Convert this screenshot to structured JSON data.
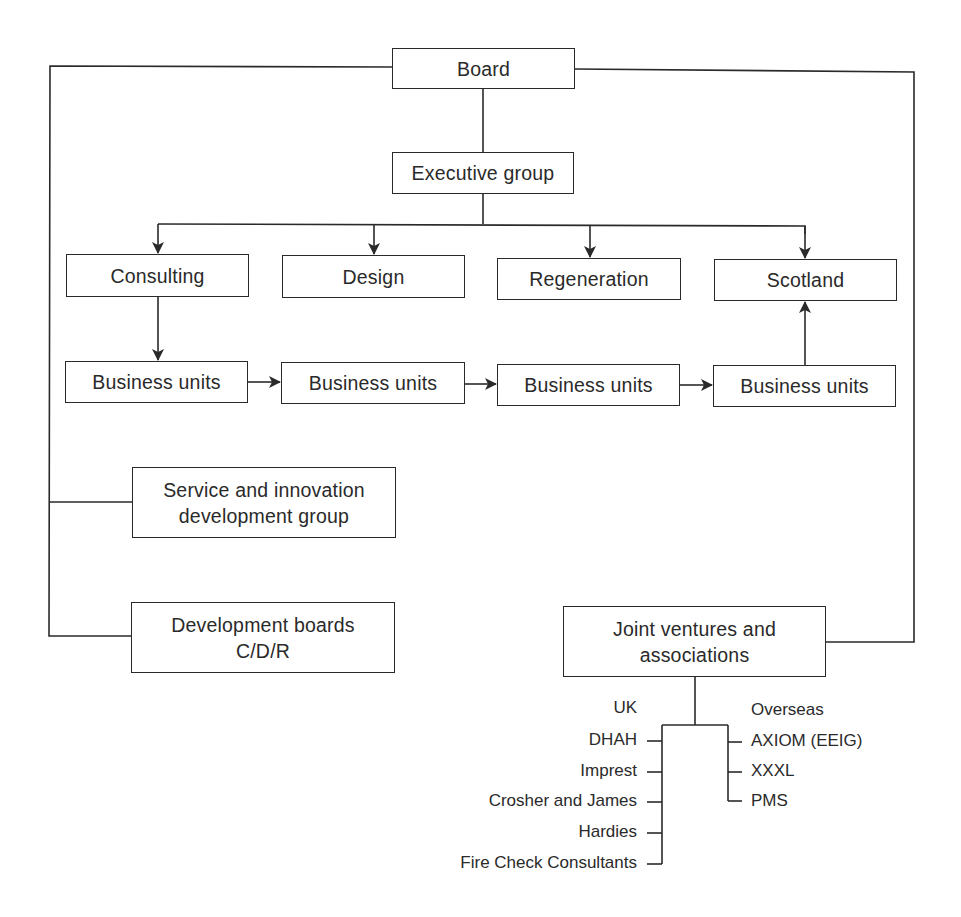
{
  "diagram": {
    "type": "organisation-chart",
    "nodes": {
      "board": "Board",
      "executive_group": "Executive group",
      "divisions": [
        "Consulting",
        "Design",
        "Regeneration",
        "Scotland"
      ],
      "business_units": [
        "Business units",
        "Business units",
        "Business units",
        "Business units"
      ],
      "service_innovation": {
        "line1": "Service and innovation",
        "line2": "development group"
      },
      "development_boards": {
        "line1": "Development boards",
        "line2": "C/D/R"
      },
      "joint_ventures": {
        "line1": "Joint ventures and",
        "line2": "associations"
      }
    },
    "joint_ventures_uk": {
      "heading": "UK",
      "items": [
        "DHAH",
        "Imprest",
        "Crosher and James",
        "Hardies",
        "Fire Check Consultants"
      ]
    },
    "joint_ventures_overseas": {
      "heading": "Overseas",
      "items": [
        "AXIOM (EEIG)",
        "XXXL",
        "PMS"
      ]
    },
    "edges": [
      {
        "from": "Board",
        "to": "Executive group",
        "arrow": false
      },
      {
        "from": "Executive group",
        "to": "Consulting",
        "arrow": true
      },
      {
        "from": "Executive group",
        "to": "Design",
        "arrow": true
      },
      {
        "from": "Executive group",
        "to": "Regeneration",
        "arrow": true
      },
      {
        "from": "Executive group",
        "to": "Scotland",
        "arrow": true
      },
      {
        "from": "Consulting",
        "to": "Business units 1",
        "arrow": true
      },
      {
        "from": "Business units 1",
        "to": "Business units 2",
        "arrow": true
      },
      {
        "from": "Business units 2",
        "to": "Business units 3",
        "arrow": true
      },
      {
        "from": "Business units 3",
        "to": "Business units 4",
        "arrow": true
      },
      {
        "from": "Business units 4",
        "to": "Scotland",
        "arrow": true
      },
      {
        "from": "Board",
        "to": "Service and innovation development group",
        "arrow": false
      },
      {
        "from": "Board",
        "to": "Development boards C/D/R",
        "arrow": false
      },
      {
        "from": "Board",
        "to": "Joint ventures and associations",
        "arrow": false
      }
    ]
  },
  "colors": {
    "line": "#2a2a2a",
    "background": "#ffffff"
  }
}
